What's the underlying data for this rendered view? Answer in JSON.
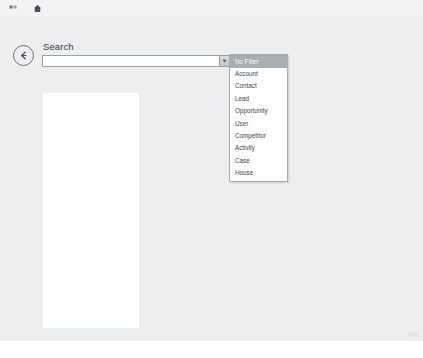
{
  "window": {
    "background_color": "#eceef0"
  },
  "top_bar": {
    "icons": [
      {
        "name": "grid-icon",
        "label": "Grid"
      },
      {
        "name": "home-icon",
        "label": "Home"
      }
    ]
  },
  "navigation": {
    "back_button_label": "Back"
  },
  "search": {
    "label": "Search",
    "value": "",
    "placeholder": "",
    "dropdown_toggle_label": "Open filter list"
  },
  "filter_menu": {
    "selected": "No Filter",
    "items": [
      {
        "label": "No Filter",
        "selected": true
      },
      {
        "label": "Account",
        "selected": false
      },
      {
        "label": "Contact",
        "selected": false
      },
      {
        "label": "Lead",
        "selected": false
      },
      {
        "label": "Opportunity",
        "selected": false
      },
      {
        "label": "User",
        "selected": false
      },
      {
        "label": "Competitor",
        "selected": false
      },
      {
        "label": "Activity",
        "selected": false
      },
      {
        "label": "Case",
        "selected": false
      },
      {
        "label": "House",
        "selected": false
      }
    ]
  },
  "results_panel": {
    "items": []
  },
  "colors": {
    "menu_highlight": "#a9aeb2",
    "panel_background": "#ffffff",
    "surface": "#eceef0"
  }
}
